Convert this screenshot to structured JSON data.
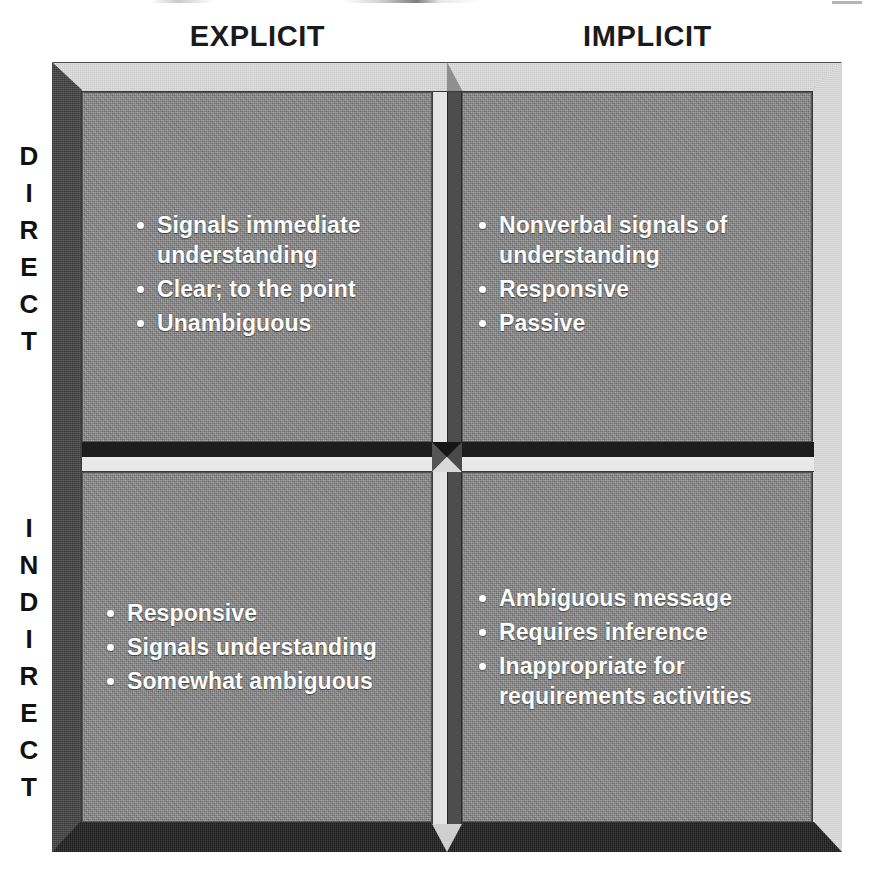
{
  "diagram": {
    "type": "2x2-matrix",
    "column_headers": [
      {
        "id": "explicit",
        "label": "EXPLICIT"
      },
      {
        "id": "implicit",
        "label": "IMPLICIT"
      }
    ],
    "row_headers": [
      {
        "id": "direct",
        "label": "DIRECT",
        "orientation": "vertical-stacked"
      },
      {
        "id": "indirect",
        "label": "INDIRECT",
        "orientation": "vertical-stacked"
      }
    ],
    "quadrants": [
      {
        "id": "direct-explicit",
        "row": "DIRECT",
        "column": "EXPLICIT",
        "bullets": [
          "Signals immediate understanding",
          "Clear; to the point",
          "Unambiguous"
        ]
      },
      {
        "id": "direct-implicit",
        "row": "DIRECT",
        "column": "IMPLICIT",
        "bullets": [
          "Nonverbal signals of understanding",
          "Responsive",
          "Passive"
        ]
      },
      {
        "id": "indirect-explicit",
        "row": "INDIRECT",
        "column": "EXPLICIT",
        "bullets": [
          "Responsive",
          "Signals understanding",
          "Somewhat ambiguous"
        ]
      },
      {
        "id": "indirect-implicit",
        "row": "INDIRECT",
        "column": "IMPLICIT",
        "bullets": [
          "Ambiguous message",
          "Requires inference",
          "Inappropriate for requirements activities"
        ]
      }
    ],
    "colors": {
      "quadrant_face": "#8b8b8b",
      "bevel_light": "#e2e2e2",
      "bevel_dark": "#4f4f4f",
      "divider_dark": "#1d1d1d",
      "divider_light": "#e8e8e8",
      "bullet_text": "#ffffff",
      "header_text": "#1a1a1a",
      "background": "#ffffff"
    }
  }
}
